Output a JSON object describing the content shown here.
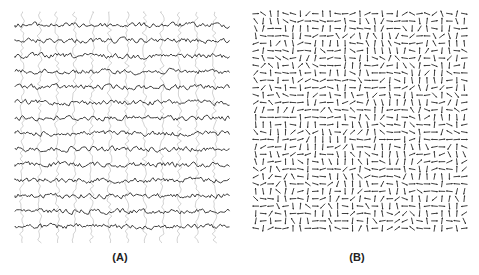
{
  "figure": {
    "panels": [
      {
        "id": "A",
        "label": "(A)",
        "description": "Stacked horizontal wavy traces with faint vertical wavy traces overlaid",
        "horizontal_traces": 14,
        "vertical_traces": 12,
        "trace_color": "#2a2a2a",
        "vertical_trace_color": "#c8c8c8"
      },
      {
        "id": "B",
        "label": "(B)",
        "description": "Dense grid of randomly oriented short arrows (vector field)",
        "grid_cols": 29,
        "grid_rows": 30,
        "arrow_color": "#2a2a2a"
      }
    ]
  },
  "colors": {
    "background": "#ffffff",
    "ink": "#2a2a2a",
    "faint": "#c8c8c8"
  }
}
